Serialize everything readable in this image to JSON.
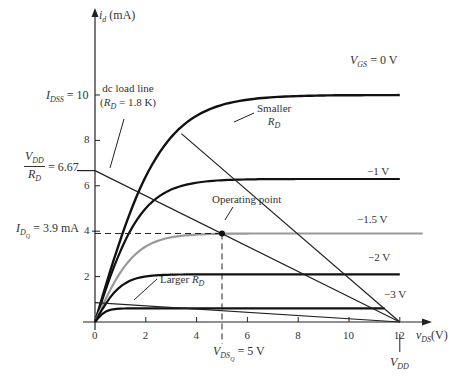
{
  "chart_data": {
    "type": "line",
    "xlabel": "v_DS (V)",
    "ylabel": "i_d (mA)",
    "xlim": [
      0,
      12.5
    ],
    "ylim": [
      0,
      11
    ],
    "x_ticks": [
      0,
      2,
      4,
      6,
      8,
      10,
      12
    ],
    "y_ticks": [
      2,
      4,
      6,
      8,
      10
    ],
    "grid": false,
    "series": [
      {
        "name": "V_GS = 0 V",
        "label": "V_GS = 0 V",
        "plateau_mA": 10,
        "knee_V": 5,
        "color": "#111111"
      },
      {
        "name": "V_GS = -1 V",
        "label": "-1 V",
        "plateau_mA": 6.3,
        "knee_V": 3.5,
        "color": "#111111"
      },
      {
        "name": "V_GS = -1.5 V",
        "label": "-1.5 V",
        "plateau_mA": 3.9,
        "knee_V": 3,
        "color": "#999999"
      },
      {
        "name": "V_GS = -2 V",
        "label": "-2 V",
        "plateau_mA": 2.1,
        "knee_V": 2,
        "color": "#111111"
      },
      {
        "name": "V_GS = -3 V",
        "label": "-3 V",
        "plateau_mA": 0.6,
        "knee_V": 0.8,
        "color": "#111111"
      }
    ],
    "load_lines": [
      {
        "name": "dc load line (R_D = 1.8K)",
        "x": [
          0,
          12
        ],
        "y": [
          6.67,
          0
        ]
      },
      {
        "name": "Smaller R_D",
        "x": [
          3.4,
          12
        ],
        "y": [
          8.3,
          0
        ]
      },
      {
        "name": "Larger R_D",
        "x": [
          0,
          12
        ],
        "y": [
          0.85,
          0
        ]
      }
    ],
    "operating_point": {
      "v_DS": 5,
      "i_D": 3.9
    },
    "annotations": [
      "I_DSS = 10",
      "V_DD / R_D = 6.67",
      "I_DQ = 3.9 mA",
      "V_DSQ = 5 V",
      "V_DD",
      "Operating point",
      "dc load line (R_D = 1.8K)",
      "Smaller R_D",
      "Larger R_D"
    ]
  },
  "labels": {
    "y_axis_var": "i",
    "y_axis_sub": "d",
    "y_axis_unit": " (mA)",
    "x_axis_var": "v",
    "x_axis_sub": "DS",
    "x_axis_unit": "(V)",
    "idss_var": "I",
    "idss_sub": "DSS",
    "idss_val": " = 10",
    "vdd_rd_num_var": "V",
    "vdd_rd_num_sub": "DD",
    "vdd_rd_den_var": "R",
    "vdd_rd_den_sub": "D",
    "vdd_rd_val": " = 6.67",
    "idq_var": "I",
    "idq_sub": "D",
    "idq_subsub": "Q",
    "idq_val": " = 3.9 mA",
    "vdsq_var": "V",
    "vdsq_sub": "DS",
    "vdsq_subsub": "Q",
    "vdsq_val": " = 5 V",
    "vdd_var": "V",
    "vdd_sub": "DD",
    "vgs_var": "V",
    "vgs_sub": "GS",
    "vgs_val": " = 0 V",
    "vgs_m1": "−1 V",
    "vgs_m15": "−1.5 V",
    "vgs_m2": "−2 V",
    "vgs_m3": "−3 V",
    "dc_load_line_1": "dc load line",
    "dc_load_line_2a": "(",
    "dc_load_line_2var": "R",
    "dc_load_line_2sub": "D",
    "dc_load_line_2b": " = 1.8 K)",
    "smaller_1": "Smaller",
    "smaller_var": "R",
    "smaller_sub": "D",
    "larger_1": "Larger ",
    "larger_var": "R",
    "larger_sub": "D",
    "operating_point": "Operating point",
    "tick_x": [
      "0",
      "2",
      "4",
      "6",
      "8",
      "10",
      "12"
    ],
    "tick_y": [
      "2",
      "4",
      "6",
      "8"
    ]
  }
}
